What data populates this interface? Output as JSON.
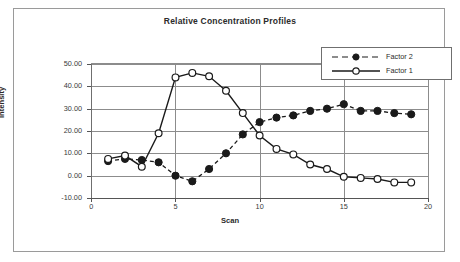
{
  "chart_data": {
    "type": "line",
    "title": "Relative Concentration Profiles",
    "xlabel": "Scan",
    "ylabel": "Intensity",
    "x": [
      1,
      2,
      3,
      4,
      5,
      6,
      7,
      8,
      9,
      10,
      11,
      12,
      13,
      14,
      15,
      16,
      17,
      18,
      19
    ],
    "xlim": [
      0,
      20
    ],
    "ylim": [
      -10,
      50
    ],
    "xticks": [
      "0",
      "5",
      "10",
      "15",
      "20"
    ],
    "yticks": [
      "50.00",
      "40.00",
      "30.00",
      "20.00",
      "10.00",
      "0.00",
      "-10.00"
    ],
    "grid": "horizontal-and-major-vertical",
    "legend_position": "top-right-inside",
    "series": [
      {
        "name": "Factor 2",
        "line_style": "dashed",
        "marker": "filled-circle",
        "color": "#1a1a1a",
        "values": [
          6.5,
          7.5,
          7.0,
          6.0,
          0.0,
          -2.5,
          3.0,
          10.0,
          18.5,
          24.0,
          26.0,
          27.0,
          29.0,
          30.0,
          32.0,
          29.0,
          29.0,
          28.0,
          27.5
        ]
      },
      {
        "name": "Factor 1",
        "line_style": "solid",
        "marker": "open-circle",
        "color": "#1a1a1a",
        "values": [
          7.5,
          9.0,
          4.0,
          19.0,
          44.0,
          46.0,
          44.5,
          38.0,
          28.0,
          18.0,
          12.0,
          9.5,
          5.0,
          3.0,
          -0.5,
          -1.0,
          -1.5,
          -3.0,
          -3.0
        ]
      }
    ]
  },
  "legend": {
    "entries": [
      {
        "label": "Factor 2"
      },
      {
        "label": "Factor 1"
      }
    ]
  }
}
